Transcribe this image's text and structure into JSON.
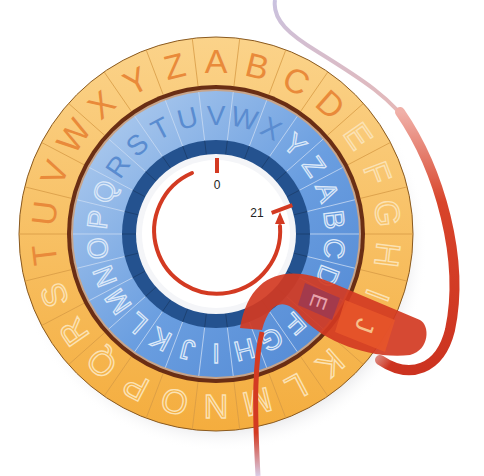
{
  "diagram": {
    "type": "caesar-cipher-wheel",
    "center": [
      216,
      234
    ],
    "outer_ring": {
      "letters": [
        "A",
        "B",
        "C",
        "D",
        "E",
        "F",
        "G",
        "H",
        "I",
        "J",
        "K",
        "L",
        "M",
        "N",
        "O",
        "P",
        "Q",
        "R",
        "S",
        "T",
        "U",
        "V",
        "W",
        "X",
        "Y",
        "Z"
      ],
      "start_letter_at_top": "A",
      "solid_letters": [
        "T",
        "U",
        "V",
        "W",
        "X",
        "Y",
        "Z",
        "A",
        "B",
        "C",
        "D"
      ],
      "color": "#f6b54c",
      "letter_color": "#e98a3a"
    },
    "inner_ring": {
      "letters": [
        "A",
        "B",
        "C",
        "D",
        "E",
        "F",
        "G",
        "H",
        "I",
        "J",
        "K",
        "L",
        "M",
        "N",
        "O",
        "P",
        "Q",
        "R",
        "S",
        "T",
        "U",
        "V",
        "W",
        "X",
        "Y",
        "Z"
      ],
      "letter_at_top": "V",
      "solid_letters": [
        "R",
        "S",
        "T",
        "U",
        "V",
        "W",
        "X"
      ],
      "color": "#6a9ee0",
      "letter_color": "#5a8cd0"
    },
    "markers": {
      "start_label": "0",
      "end_label": "21",
      "shift": 21
    },
    "highlight": {
      "plain_letter": "E",
      "cipher_letter": "J",
      "band_color": "#d33a22",
      "highlight_inner_color": "#9e3a50",
      "highlight_outer_color": "#e8562a"
    },
    "colors": {
      "ring_divider": "#6a2e14",
      "dark_blue_band": "#24528f",
      "arrow": "#d33a22",
      "lavender_line": "#c9c2e0"
    }
  }
}
